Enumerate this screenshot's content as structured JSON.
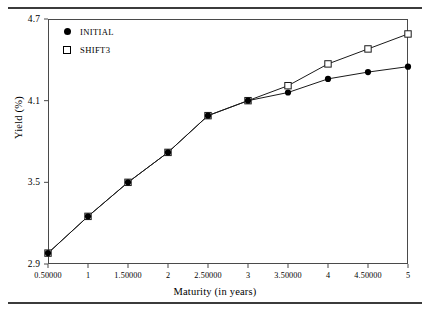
{
  "chart_data": {
    "type": "line",
    "title": "",
    "xlabel": "Maturity (in years)",
    "ylabel": "Yield (%)",
    "xlim": [
      0.5,
      5
    ],
    "ylim": [
      2.9,
      4.7
    ],
    "grid": false,
    "legend_position": "top-left",
    "x": [
      0.5,
      1,
      1.5,
      2,
      2.5,
      3,
      3.5,
      4,
      4.5,
      5
    ],
    "x_tick_labels": [
      "0.50000",
      "1",
      "1.50000",
      "2",
      "2.50000",
      "3",
      "3.50000",
      "4",
      "4.50000",
      "5"
    ],
    "y_tick_labels": [
      "2.9",
      "3.5",
      "4.1",
      "4.7"
    ],
    "y_ticks": [
      2.9,
      3.5,
      4.1,
      4.7
    ],
    "series": [
      {
        "name": "INITIAL",
        "marker": "filled-circle",
        "values": [
          2.98,
          3.25,
          3.5,
          3.72,
          3.99,
          4.1,
          4.16,
          4.26,
          4.31,
          4.35
        ]
      },
      {
        "name": "SHIFT3",
        "marker": "open-square",
        "values": [
          2.98,
          3.25,
          3.5,
          3.72,
          3.99,
          4.1,
          4.21,
          4.37,
          4.48,
          4.59
        ]
      }
    ]
  },
  "legend": {
    "items": [
      {
        "label": "INITIAL",
        "marker": "filled-circle"
      },
      {
        "label": "SHIFT3",
        "marker": "open-square"
      }
    ]
  },
  "axes": {
    "x_title": "Maturity (in years)",
    "y_title": "Yield (%)"
  },
  "colors": {
    "line": "#1a1a1a",
    "frame": "#4a4a4a",
    "rule": "#3b3b3b",
    "marker_fill": "#000000",
    "marker_open": "#ffffff"
  }
}
